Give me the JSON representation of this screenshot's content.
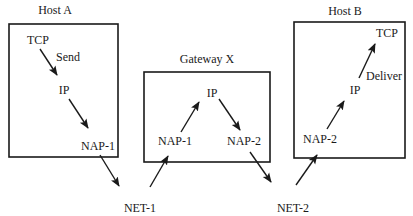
{
  "diagram": {
    "nodes": {
      "host_a": {
        "title": "Host A",
        "tcp": "TCP",
        "send": "Send",
        "ip": "IP",
        "nap": "NAP-1"
      },
      "gateway_x": {
        "title": "Gateway X",
        "ip": "IP",
        "nap1": "NAP-1",
        "nap2": "NAP-2"
      },
      "host_b": {
        "title": "Host B",
        "tcp": "TCP",
        "deliver": "Deliver",
        "ip": "IP",
        "nap": "NAP-2"
      }
    },
    "networks": {
      "net1": "NET-1",
      "net2": "NET-2"
    },
    "edges": [
      {
        "from": "Host A TCP",
        "to": "Host A IP",
        "label": "Send"
      },
      {
        "from": "Host A IP",
        "to": "Host A NAP-1"
      },
      {
        "from": "Host A NAP-1",
        "to": "NET-1"
      },
      {
        "from": "NET-1",
        "to": "Gateway X NAP-1"
      },
      {
        "from": "Gateway X NAP-1",
        "to": "Gateway X IP"
      },
      {
        "from": "Gateway X IP",
        "to": "Gateway X NAP-2"
      },
      {
        "from": "Gateway X NAP-2",
        "to": "NET-2"
      },
      {
        "from": "NET-2",
        "to": "Host B NAP-2"
      },
      {
        "from": "Host B NAP-2",
        "to": "Host B IP"
      },
      {
        "from": "Host B IP",
        "to": "Host B TCP",
        "label": "Deliver"
      }
    ]
  }
}
